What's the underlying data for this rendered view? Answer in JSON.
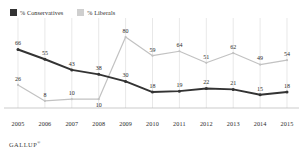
{
  "legend": {
    "entries": [
      {
        "label": "% Conservatives",
        "color": "#333333",
        "name": "conservatives"
      },
      {
        "label": "% Liberals",
        "color": "#c9c9c9",
        "name": "liberals"
      }
    ]
  },
  "footer": {
    "source": "GALLUP",
    "mark": "®"
  },
  "colors": {
    "conservatives": "#333333",
    "liberals": "#c2c2c2",
    "gridline": "#d8d8d8",
    "axis": "#b4b4b4",
    "label_text": "#2b2b2b"
  },
  "chart_data": {
    "type": "line",
    "title": "",
    "subtitle": "",
    "xlabel": "",
    "ylabel": "",
    "categories": [
      "2005",
      "2006",
      "2007",
      "2008",
      "2009",
      "2010",
      "2011",
      "2012",
      "2013",
      "2014",
      "2015"
    ],
    "series": [
      {
        "name": "% Conservatives",
        "color": "#333333",
        "values": [
          66,
          55,
          43,
          38,
          30,
          18,
          19,
          22,
          21,
          15,
          18
        ]
      },
      {
        "name": "% Liberals",
        "color": "#c2c2c2",
        "values": [
          26,
          8,
          10,
          10,
          80,
          59,
          64,
          51,
          62,
          49,
          54
        ]
      }
    ],
    "ylim": [
      0,
      88
    ],
    "grid": "vertical",
    "legend_position": "top-left",
    "data_labels": true
  }
}
